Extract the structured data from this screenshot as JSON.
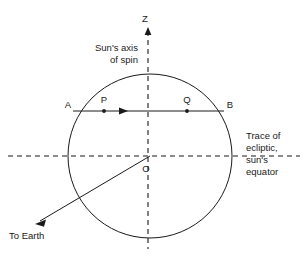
{
  "figure": {
    "background_color": "#ffffff",
    "stroke_color": "#1a1a1a",
    "text_color": "#1a1a1a"
  },
  "labels": {
    "z_axis": "Z",
    "spin_axis_line1": "Sun's axis",
    "spin_axis_line2": "of spin",
    "point_a": "A",
    "point_p": "P",
    "point_q": "Q",
    "point_b": "B",
    "center_o": "O",
    "to_earth": "To Earth",
    "trace_line1": "Trace of",
    "trace_line2": "ecliptic,",
    "trace_line3": "sun's",
    "trace_line4": "equator"
  },
  "geometry": {
    "circle": {
      "cx": 150,
      "cy": 156,
      "r": 82
    },
    "spin_axis": {
      "x": 148,
      "y_top": 30,
      "y_bottom": 248
    },
    "ecliptic": {
      "y": 156,
      "x_left": 8,
      "x_right": 300
    },
    "chord_ab": {
      "y": 111,
      "x_a": 73,
      "x_b": 224
    },
    "point_p": {
      "x": 104,
      "y": 111
    },
    "point_q": {
      "x": 187,
      "y": 111
    },
    "chord_arrow": {
      "x": 122,
      "y": 111
    },
    "to_earth_ray": {
      "x_start": 150,
      "y_start": 156,
      "x_end": 38,
      "y_end": 222
    }
  }
}
